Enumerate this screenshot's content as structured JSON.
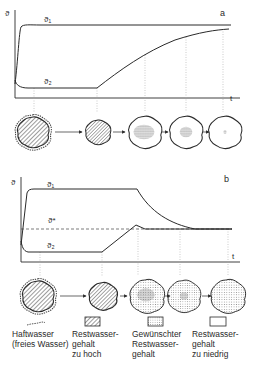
{
  "panel_a": {
    "label": "a",
    "y_axis_label": "ϑ",
    "x_axis_label": "t",
    "curve_1_label": "ϑ₁",
    "curve_2_label": "ϑ₂",
    "particles": [
      {
        "state": "haftwasser-and-rest-too-high"
      },
      {
        "state": "rest-too-high"
      },
      {
        "state": "drying-core-dense"
      },
      {
        "state": "drying-core-smaller"
      },
      {
        "state": "rest-too-low"
      }
    ]
  },
  "panel_b": {
    "label": "b",
    "y_axis_label": "ϑ",
    "x_axis_label": "t",
    "curve_1_label": "ϑ₁",
    "curve_2_label": "ϑ₂",
    "setpoint_label": "ϑ*",
    "particles": [
      {
        "state": "haftwasser-and-rest-too-high"
      },
      {
        "state": "rest-too-high"
      },
      {
        "state": "desired-with-core"
      },
      {
        "state": "desired-with-small-core"
      },
      {
        "state": "desired"
      }
    ]
  },
  "legend": [
    {
      "key": "haftwasser",
      "line1": "Haftwasser",
      "line2": "(freies Wasser)",
      "line3": ""
    },
    {
      "key": "rest-too-high",
      "line1": "Restwasser-",
      "line2": "gehalt",
      "line3": "zu hoch"
    },
    {
      "key": "desired",
      "line1": "Gewünschter",
      "line2": "Restwasser-",
      "line3": "gehalt"
    },
    {
      "key": "rest-too-low",
      "line1": "Restwasser-",
      "line2": "gehalt",
      "line3": "zu niedrig"
    }
  ],
  "colors": {
    "ink": "#2a2a2a",
    "guide": "#9a9a9a",
    "background": "#ffffff"
  }
}
